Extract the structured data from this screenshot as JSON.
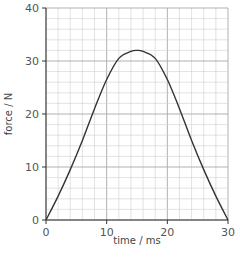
{
  "chart_data": {
    "type": "line",
    "title": "",
    "xlabel": "time / ms",
    "ylabel": "force / N",
    "xlim": [
      0,
      30
    ],
    "ylim": [
      0,
      40
    ],
    "x_ticks": [
      0,
      10,
      20,
      30
    ],
    "y_ticks": [
      0,
      10,
      20,
      30,
      40
    ],
    "x_minor_step": 2,
    "y_minor_step": 2,
    "grid": true,
    "legend": null,
    "series": [
      {
        "name": "force",
        "x": [
          0,
          2,
          4,
          6,
          8,
          10,
          12,
          14,
          15,
          16,
          18,
          20,
          22,
          24,
          26,
          28,
          30
        ],
        "values": [
          0,
          4.5,
          9.5,
          15,
          21,
          26.5,
          30.5,
          31.8,
          32,
          31.8,
          30.5,
          26.5,
          21,
          15,
          9.5,
          4.5,
          0
        ]
      }
    ],
    "colors": {
      "line": "#333333",
      "grid_minor": "#cfcfcf",
      "grid_major": "#a8a8a8",
      "axis": "#333333"
    }
  }
}
